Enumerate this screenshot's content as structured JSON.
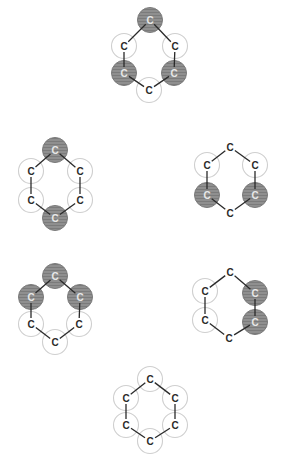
{
  "diagram": {
    "title": "",
    "atom_label": "C",
    "colors": {
      "bond": "#2a2a2a",
      "empty_circle_stroke": "#cfcfcf",
      "shaded_fill": "#8a8a8a"
    },
    "molecules": [
      {
        "id": "top",
        "atoms": [
          {
            "label": "C",
            "x": 150,
            "y": 20,
            "circle": "shaded"
          },
          {
            "label": "C",
            "x": 175,
            "y": 46,
            "circle": "empty"
          },
          {
            "label": "C",
            "x": 174,
            "y": 73,
            "circle": "shaded"
          },
          {
            "label": "C",
            "x": 149,
            "y": 90,
            "circle": "empty"
          },
          {
            "label": "C",
            "x": 124,
            "y": 73,
            "circle": "shaded"
          },
          {
            "label": "C",
            "x": 124,
            "y": 46,
            "circle": "empty"
          }
        ]
      },
      {
        "id": "middle-left",
        "atoms": [
          {
            "label": "C",
            "x": 55,
            "y": 150,
            "circle": "shaded"
          },
          {
            "label": "C",
            "x": 80,
            "y": 171,
            "circle": "empty"
          },
          {
            "label": "C",
            "x": 80,
            "y": 200,
            "circle": "empty"
          },
          {
            "label": "C",
            "x": 55,
            "y": 218,
            "circle": "shaded"
          },
          {
            "label": "C",
            "x": 31,
            "y": 200,
            "circle": "empty"
          },
          {
            "label": "C",
            "x": 31,
            "y": 171,
            "circle": "empty"
          }
        ]
      },
      {
        "id": "middle-right",
        "atoms": [
          {
            "label": "C",
            "x": 230,
            "y": 147,
            "circle": "none"
          },
          {
            "label": "C",
            "x": 255,
            "y": 165,
            "circle": "empty"
          },
          {
            "label": "C",
            "x": 255,
            "y": 195,
            "circle": "shaded"
          },
          {
            "label": "C",
            "x": 230,
            "y": 213,
            "circle": "none"
          },
          {
            "label": "C",
            "x": 207,
            "y": 195,
            "circle": "shaded"
          },
          {
            "label": "C",
            "x": 207,
            "y": 165,
            "circle": "empty"
          }
        ]
      },
      {
        "id": "lower-left",
        "atoms": [
          {
            "label": "C",
            "x": 55,
            "y": 276,
            "circle": "shaded"
          },
          {
            "label": "C",
            "x": 80,
            "y": 297,
            "circle": "shaded"
          },
          {
            "label": "C",
            "x": 79,
            "y": 324,
            "circle": "empty"
          },
          {
            "label": "C",
            "x": 55,
            "y": 342,
            "circle": "empty"
          },
          {
            "label": "C",
            "x": 31,
            "y": 324,
            "circle": "empty"
          },
          {
            "label": "C",
            "x": 31,
            "y": 297,
            "circle": "shaded"
          }
        ]
      },
      {
        "id": "lower-right",
        "atoms": [
          {
            "label": "C",
            "x": 230,
            "y": 272,
            "circle": "none"
          },
          {
            "label": "C",
            "x": 255,
            "y": 293,
            "circle": "shaded"
          },
          {
            "label": "C",
            "x": 255,
            "y": 322,
            "circle": "shaded"
          },
          {
            "label": "C",
            "x": 229,
            "y": 338,
            "circle": "none"
          },
          {
            "label": "C",
            "x": 205,
            "y": 320,
            "circle": "empty"
          },
          {
            "label": "C",
            "x": 205,
            "y": 291,
            "circle": "empty"
          }
        ]
      },
      {
        "id": "bottom",
        "atoms": [
          {
            "label": "C",
            "x": 150,
            "y": 379,
            "circle": "empty"
          },
          {
            "label": "C",
            "x": 175,
            "y": 398,
            "circle": "empty"
          },
          {
            "label": "C",
            "x": 175,
            "y": 425,
            "circle": "empty"
          },
          {
            "label": "C",
            "x": 150,
            "y": 441,
            "circle": "empty"
          },
          {
            "label": "C",
            "x": 126,
            "y": 425,
            "circle": "empty"
          },
          {
            "label": "C",
            "x": 126,
            "y": 398,
            "circle": "empty"
          }
        ]
      }
    ]
  }
}
